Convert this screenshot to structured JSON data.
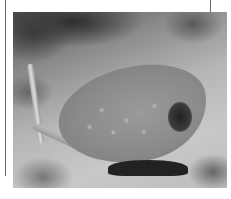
{
  "image": {
    "subject": "stingray resting on sandy seabed",
    "style": "grayscale photograph",
    "frame_lines": [
      "left vertical rule",
      "right vertical rule"
    ]
  }
}
